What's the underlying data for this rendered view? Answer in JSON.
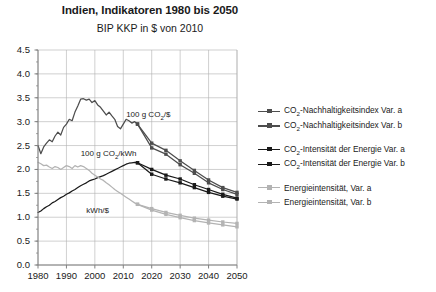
{
  "chart_data": {
    "type": "line",
    "title": "Indien, Indikatoren 1980 bis 2050",
    "subtitle": "BIP KKP in $ von 2010",
    "xlabel": "",
    "ylabel": "",
    "xlim": [
      1980,
      2050
    ],
    "ylim": [
      0.0,
      4.5
    ],
    "grid": true,
    "legend_position": "right",
    "xticks": [
      1980,
      1990,
      2000,
      2010,
      2020,
      2030,
      2040,
      2050
    ],
    "yticks": [
      0.0,
      0.5,
      1.0,
      1.5,
      2.0,
      2.5,
      3.0,
      3.5,
      4.0,
      4.5
    ],
    "ytick_labels": [
      "0.0",
      "0.5",
      "1.0",
      "1.5",
      "2.0",
      "2.5",
      "3.0",
      "3.5",
      "4.0",
      "4.5"
    ],
    "xtick_labels": [
      "1980",
      "1990",
      "2000",
      "2010",
      "2020",
      "2030",
      "2040",
      "2050"
    ],
    "annotations": [
      {
        "text": "100 g CO2/$",
        "html": "100 g CO<sub>2</sub>/$",
        "x": 2011,
        "y": 3.15
      },
      {
        "text": "100 g CO2/kWh",
        "html": "100 g CO<sub>2</sub>/kWh",
        "x": 1995,
        "y": 2.32
      },
      {
        "text": "kWh/$",
        "html": "kWh/$",
        "x": 1997,
        "y": 1.13
      }
    ],
    "colors": {
      "dark_gray": "#4d4d4d",
      "black": "#1a1a1a",
      "light_gray": "#b3b3b3",
      "grid": "#b0b0b0",
      "axis": "#808080"
    },
    "series": [
      {
        "name": "CO2-Nachhaltigkeitsindex Var. a",
        "legend_html": "CO<sub>2</sub>-Nachhaltigkeitsindex Var. a",
        "color": "#4d4d4d",
        "marker": "square",
        "x": [
          1980,
          1981,
          1982,
          1983,
          1984,
          1985,
          1986,
          1987,
          1988,
          1989,
          1990,
          1991,
          1992,
          1993,
          1994,
          1995,
          1996,
          1997,
          1998,
          1999,
          2000,
          2001,
          2002,
          2003,
          2004,
          2005,
          2006,
          2007,
          2008,
          2009,
          2010,
          2011,
          2012,
          2013,
          2014,
          2015,
          2020,
          2025,
          2030,
          2035,
          2040,
          2045,
          2050
        ],
        "values": [
          2.5,
          2.33,
          2.47,
          2.55,
          2.62,
          2.58,
          2.7,
          2.78,
          2.72,
          2.88,
          2.95,
          3.05,
          3.02,
          3.2,
          3.33,
          3.47,
          3.48,
          3.45,
          3.47,
          3.4,
          3.44,
          3.35,
          3.3,
          3.22,
          3.14,
          3.2,
          3.12,
          3.05,
          2.9,
          2.85,
          2.95,
          3.05,
          3.02,
          2.97,
          3.0,
          2.95,
          2.45,
          2.32,
          2.1,
          1.92,
          1.72,
          1.58,
          1.48
        ]
      },
      {
        "name": "CO2-Nachhaltigkeitsindex Var. b",
        "legend_html": "CO<sub>2</sub>-Nachhaltigkeitsindex Var. b",
        "color": "#4d4d4d",
        "marker": "square",
        "x": [
          2015,
          2020,
          2025,
          2030,
          2035,
          2040,
          2045,
          2050
        ],
        "values": [
          2.95,
          2.55,
          2.4,
          2.18,
          1.98,
          1.78,
          1.62,
          1.52
        ]
      },
      {
        "name": "CO2-Intensitaet der Energie Var. a",
        "legend_html": "CO<sub>2</sub>-Intensit&auml;t der Energie Var. a",
        "color": "#1a1a1a",
        "marker": "square",
        "x": [
          1980,
          1981,
          1982,
          1983,
          1984,
          1985,
          1986,
          1987,
          1988,
          1989,
          1990,
          1991,
          1992,
          1993,
          1994,
          1995,
          1996,
          1997,
          1998,
          1999,
          2000,
          2001,
          2002,
          2003,
          2004,
          2005,
          2006,
          2007,
          2008,
          2009,
          2010,
          2011,
          2012,
          2013,
          2014,
          2015,
          2020,
          2025,
          2030,
          2035,
          2040,
          2045,
          2050
        ],
        "values": [
          1.1,
          1.13,
          1.18,
          1.22,
          1.25,
          1.3,
          1.33,
          1.37,
          1.41,
          1.44,
          1.48,
          1.51,
          1.55,
          1.58,
          1.62,
          1.66,
          1.69,
          1.72,
          1.76,
          1.78,
          1.8,
          1.83,
          1.85,
          1.87,
          1.9,
          1.93,
          1.96,
          1.99,
          2.02,
          2.05,
          2.08,
          2.11,
          2.13,
          2.14,
          2.15,
          2.14,
          2.0,
          1.88,
          1.8,
          1.68,
          1.58,
          1.48,
          1.4
        ]
      },
      {
        "name": "CO2-Intensitaet der Energie Var. b",
        "legend_html": "CO<sub>2</sub>-Intensit&auml;t der Energie Var. b",
        "color": "#1a1a1a",
        "marker": "square",
        "x": [
          2015,
          2020,
          2025,
          2030,
          2035,
          2040,
          2045,
          2050
        ],
        "values": [
          2.14,
          1.9,
          1.8,
          1.72,
          1.62,
          1.52,
          1.44,
          1.38
        ]
      },
      {
        "name": "Energieintensitaet, Var. a",
        "legend_html": "Energieintensit&auml;t, Var. a",
        "color": "#b3b3b3",
        "marker": "square",
        "x": [
          1980,
          1981,
          1982,
          1983,
          1984,
          1985,
          1986,
          1987,
          1988,
          1989,
          1990,
          1991,
          1992,
          1993,
          1994,
          1995,
          1996,
          1997,
          1998,
          1999,
          2000,
          2001,
          2002,
          2003,
          2004,
          2005,
          2006,
          2007,
          2008,
          2009,
          2010,
          2011,
          2012,
          2013,
          2014,
          2015,
          2020,
          2025,
          2030,
          2035,
          2040,
          2045,
          2050
        ],
        "values": [
          2.15,
          2.12,
          2.08,
          2.09,
          2.05,
          2.02,
          2.06,
          2.04,
          2.0,
          2.04,
          2.08,
          2.06,
          2.02,
          2.08,
          2.05,
          2.08,
          2.06,
          2.02,
          1.98,
          1.92,
          1.88,
          1.84,
          1.8,
          1.77,
          1.72,
          1.68,
          1.63,
          1.58,
          1.54,
          1.5,
          1.46,
          1.42,
          1.38,
          1.34,
          1.3,
          1.27,
          1.18,
          1.1,
          1.04,
          0.98,
          0.94,
          0.9,
          0.87
        ]
      },
      {
        "name": "Energieintensitaet, Var. b",
        "legend_html": "Energieintensit&auml;t, Var. b",
        "color": "#b3b3b3",
        "marker": "square",
        "x": [
          2015,
          2020,
          2025,
          2030,
          2035,
          2040,
          2045,
          2050
        ],
        "values": [
          1.27,
          1.15,
          1.06,
          0.99,
          0.93,
          0.88,
          0.84,
          0.8
        ]
      }
    ]
  },
  "legend": {
    "items": [
      {
        "label": "CO2-Nachhaltigkeitsindex Var. a",
        "html": "CO<sub>2</sub>-Nachhaltigkeitsindex Var. a",
        "color": "#4d4d4d",
        "gap": false
      },
      {
        "label": "CO2-Nachhaltigkeitsindex Var. b",
        "html": "CO<sub>2</sub>-Nachhaltigkeitsindex Var. b",
        "color": "#4d4d4d",
        "gap": false
      },
      {
        "label": "CO2-Intensitaet der Energie Var. a",
        "html": "CO<sub>2</sub>-Intensit&auml;t der Energie Var. a",
        "color": "#1a1a1a",
        "gap": true
      },
      {
        "label": "CO2-Intensitaet der Energie Var. b",
        "html": "CO<sub>2</sub>-Intensit&auml;t der Energie Var. b",
        "color": "#1a1a1a",
        "gap": false
      },
      {
        "label": "Energieintensitaet, Var. a",
        "html": "Energieintensit&auml;t, Var. a",
        "color": "#b3b3b3",
        "gap": true
      },
      {
        "label": "Energieintensitaet, Var. b",
        "html": "Energieintensit&auml;t, Var. b",
        "color": "#b3b3b3",
        "gap": false
      }
    ]
  }
}
